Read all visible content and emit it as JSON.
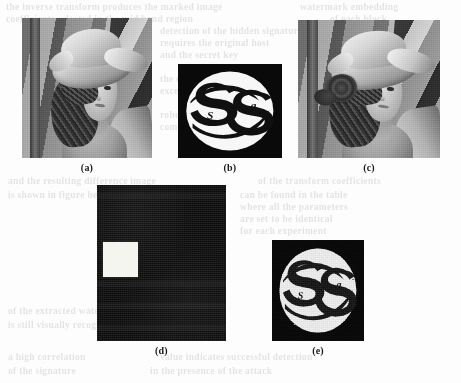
{
  "figure": {
    "kind": "scanned-paper-figure",
    "background_color": "#fdfdfd",
    "page_width": 461,
    "page_height": 383,
    "panels": [
      {
        "id": "a",
        "caption": "(a)",
        "content": "grayscale-lena-portrait",
        "description": "Original grayscale Lena host image",
        "x": 22,
        "y": 18,
        "w": 130,
        "h": 140
      },
      {
        "id": "b",
        "caption": "(b)",
        "content": "ss-logo-binary-watermark",
        "description": "Binary SS logo watermark on black square, white disc background",
        "x": 178,
        "y": 64,
        "w": 104,
        "h": 94
      },
      {
        "id": "c",
        "caption": "(c)",
        "content": "grayscale-lena-portrait-watermarked",
        "description": "Watermarked Lena image with rose detail",
        "x": 298,
        "y": 20,
        "w": 142,
        "h": 138
      },
      {
        "id": "d",
        "caption": "(d)",
        "content": "difference-map-dark-with-white-square",
        "description": "Near-black difference map with a bright white square region",
        "x": 97,
        "y": 185,
        "w": 129,
        "h": 156
      },
      {
        "id": "e",
        "caption": "(e)",
        "content": "ss-logo-extracted-noisy",
        "description": "Extracted SS logo watermark with speckle noise",
        "x": 272,
        "y": 240,
        "w": 92,
        "h": 101
      }
    ],
    "logo": {
      "primary_letters": "SS",
      "small_letter_left": "S",
      "small_letter_right": "g",
      "ink_color": "#111111",
      "disc_color": "#f7f7f7",
      "frame_color": "#0a0a0a"
    },
    "diff_map": {
      "background_color": "#0c0c0c",
      "highlight_color": "#f5f5f0",
      "highlight_x": 103,
      "highlight_y": 242,
      "highlight_w": 35,
      "highlight_h": 35
    },
    "ghost_text": {
      "note": "faint bleed-through text from reverse side of the printed page, illegible",
      "lines": [
        {
          "x": 6,
          "y": 2,
          "text": "the  inverse  transform  produces  the  marked  image"
        },
        {
          "x": 300,
          "y": 2,
          "text": "watermark  embedding"
        },
        {
          "x": 6,
          "y": 14,
          "text": "coefficients  selected  in  the  mid  band  region"
        },
        {
          "x": 330,
          "y": 14,
          "text": "of  each  block"
        },
        {
          "x": 160,
          "y": 26,
          "text": "detection  of  the  hidden  signature"
        },
        {
          "x": 160,
          "y": 38,
          "text": "requires  the  original  host"
        },
        {
          "x": 160,
          "y": 50,
          "text": "and  the  secret  key"
        },
        {
          "x": 160,
          "y": 74,
          "text": "the  correlation  value"
        },
        {
          "x": 160,
          "y": 86,
          "text": "exceeds  the  threshold"
        },
        {
          "x": 160,
          "y": 110,
          "text": "robustness  against  JPEG"
        },
        {
          "x": 160,
          "y": 122,
          "text": "compression  is  verified"
        },
        {
          "x": 8,
          "y": 176,
          "text": "and   the   resulting   difference   image"
        },
        {
          "x": 258,
          "y": 176,
          "text": "of  the  transform  coefficients"
        },
        {
          "x": 8,
          "y": 190,
          "text": "is  shown  in  figure  below"
        },
        {
          "x": 240,
          "y": 190,
          "text": "can  be  found  in  the  table"
        },
        {
          "x": 240,
          "y": 202,
          "text": "where  all  the  parameters"
        },
        {
          "x": 240,
          "y": 214,
          "text": "are  set  to  be  identical"
        },
        {
          "x": 240,
          "y": 226,
          "text": "for  each  experiment"
        },
        {
          "x": 8,
          "y": 306,
          "text": "of   the   extracted   watermark"
        },
        {
          "x": 8,
          "y": 320,
          "text": "is  still  visually  recognizable"
        },
        {
          "x": 8,
          "y": 352,
          "text": "a   high   correlation"
        },
        {
          "x": 160,
          "y": 352,
          "text": "value  indicates  successful  detection"
        },
        {
          "x": 8,
          "y": 366,
          "text": "of  the  signature"
        },
        {
          "x": 150,
          "y": 366,
          "text": "in  the  presence  of  the  attack"
        }
      ]
    }
  }
}
